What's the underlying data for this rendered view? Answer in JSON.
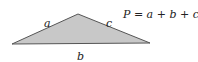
{
  "diagram": {
    "shape": "triangle",
    "fill_color": "#c8c8c8",
    "stroke_color": "#555555",
    "vertices": [
      [
        12,
        44
      ],
      [
        78,
        14
      ],
      [
        150,
        43
      ]
    ],
    "labels": {
      "a": "a",
      "b": "b",
      "c": "c"
    },
    "formula": "P = a + b + c"
  }
}
